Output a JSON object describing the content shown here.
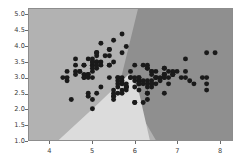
{
  "chart_data": {
    "type": "scatter",
    "title": "",
    "subtitle": "",
    "xlabel": "",
    "ylabel": "",
    "xlim": [
      3.5,
      8.3
    ],
    "ylim": [
      1.0,
      5.2
    ],
    "grid": false,
    "legend_position": "none",
    "xticks": [
      4,
      5,
      6,
      7,
      8
    ],
    "xtick_labels": [
      "4",
      "5",
      "6",
      "7",
      "8"
    ],
    "yticks": [
      1.0,
      1.5,
      2.0,
      2.5,
      3.0,
      3.5,
      4.0,
      4.5,
      5.0
    ],
    "ytick_labels": [
      "1.0",
      "1.5",
      "2.0",
      "2.5",
      "3.0",
      "3.5",
      "4.0",
      "4.5",
      "5.0"
    ],
    "background_color": "#b4b4b4",
    "regions": [
      {
        "name": "region-class-0",
        "label": "Class 0 decision region",
        "color": "#b2b2b2",
        "description": "Upper-left medium gray region"
      },
      {
        "name": "region-class-1",
        "label": "Class 1 decision region",
        "color": "#dcdcdc",
        "description": "Light gray wedge widening toward bottom-center"
      },
      {
        "name": "region-class-2",
        "label": "Class 2 decision region",
        "color": "#8f8f8f",
        "description": "Darker gray region on the right"
      }
    ],
    "series": [
      {
        "name": "Class 0",
        "marker": "circle",
        "color": "#1a1a1a",
        "points": [
          [
            5.1,
            3.5
          ],
          [
            4.9,
            3.0
          ],
          [
            4.7,
            3.2
          ],
          [
            4.6,
            3.1
          ],
          [
            5.0,
            3.6
          ],
          [
            5.4,
            3.9
          ],
          [
            4.6,
            3.4
          ],
          [
            5.0,
            3.4
          ],
          [
            4.4,
            2.9
          ],
          [
            4.9,
            3.1
          ],
          [
            5.4,
            3.7
          ],
          [
            4.8,
            3.4
          ],
          [
            4.8,
            3.0
          ],
          [
            4.3,
            3.0
          ],
          [
            5.8,
            4.0
          ],
          [
            5.7,
            4.4
          ],
          [
            5.4,
            3.9
          ],
          [
            5.1,
            3.5
          ],
          [
            5.7,
            3.8
          ],
          [
            5.1,
            3.8
          ],
          [
            5.4,
            3.4
          ],
          [
            5.1,
            3.7
          ],
          [
            4.6,
            3.6
          ],
          [
            5.1,
            3.3
          ],
          [
            4.8,
            3.4
          ],
          [
            5.0,
            3.0
          ],
          [
            5.0,
            3.4
          ],
          [
            5.2,
            3.5
          ],
          [
            5.2,
            3.4
          ],
          [
            4.7,
            3.2
          ],
          [
            4.8,
            3.1
          ],
          [
            5.4,
            3.4
          ],
          [
            5.2,
            4.1
          ],
          [
            5.5,
            4.2
          ],
          [
            4.9,
            3.1
          ],
          [
            5.0,
            3.2
          ],
          [
            5.5,
            3.5
          ],
          [
            4.9,
            3.6
          ],
          [
            4.4,
            3.0
          ],
          [
            5.1,
            3.4
          ],
          [
            5.0,
            3.5
          ],
          [
            4.5,
            2.3
          ],
          [
            4.4,
            3.2
          ],
          [
            5.0,
            3.5
          ],
          [
            5.1,
            3.8
          ],
          [
            4.8,
            3.0
          ],
          [
            5.1,
            3.8
          ],
          [
            4.6,
            3.2
          ],
          [
            5.3,
            3.7
          ],
          [
            5.0,
            3.3
          ]
        ]
      },
      {
        "name": "Class 1",
        "marker": "circle",
        "color": "#1a1a1a",
        "points": [
          [
            7.0,
            3.2
          ],
          [
            6.4,
            3.2
          ],
          [
            6.9,
            3.1
          ],
          [
            5.5,
            2.3
          ],
          [
            6.5,
            2.8
          ],
          [
            5.7,
            2.8
          ],
          [
            6.3,
            3.3
          ],
          [
            4.9,
            2.4
          ],
          [
            6.6,
            2.9
          ],
          [
            5.2,
            2.7
          ],
          [
            5.0,
            2.0
          ],
          [
            5.9,
            3.0
          ],
          [
            6.0,
            2.2
          ],
          [
            6.1,
            2.9
          ],
          [
            5.6,
            2.9
          ],
          [
            6.7,
            3.1
          ],
          [
            5.6,
            3.0
          ],
          [
            5.8,
            2.7
          ],
          [
            6.2,
            2.2
          ],
          [
            5.6,
            2.5
          ],
          [
            5.9,
            3.2
          ],
          [
            6.1,
            2.8
          ],
          [
            6.3,
            2.5
          ],
          [
            6.1,
            2.8
          ],
          [
            6.4,
            2.9
          ],
          [
            6.6,
            3.0
          ],
          [
            6.8,
            2.8
          ],
          [
            6.7,
            3.0
          ],
          [
            6.0,
            2.9
          ],
          [
            5.7,
            2.6
          ],
          [
            5.5,
            2.4
          ],
          [
            5.5,
            2.4
          ],
          [
            5.8,
            2.7
          ],
          [
            6.0,
            2.7
          ],
          [
            5.4,
            3.0
          ],
          [
            6.0,
            3.4
          ],
          [
            6.7,
            3.1
          ],
          [
            6.3,
            2.3
          ],
          [
            5.6,
            3.0
          ],
          [
            5.5,
            2.5
          ],
          [
            5.5,
            2.6
          ],
          [
            6.1,
            3.0
          ],
          [
            5.8,
            2.6
          ],
          [
            5.0,
            2.3
          ],
          [
            5.6,
            2.7
          ],
          [
            5.7,
            3.0
          ],
          [
            5.7,
            2.9
          ],
          [
            6.2,
            2.9
          ],
          [
            5.1,
            2.5
          ],
          [
            5.7,
            2.8
          ]
        ]
      },
      {
        "name": "Class 2",
        "marker": "circle",
        "color": "#1a1a1a",
        "points": [
          [
            6.3,
            3.3
          ],
          [
            5.8,
            2.7
          ],
          [
            7.1,
            3.0
          ],
          [
            6.3,
            2.9
          ],
          [
            6.5,
            3.0
          ],
          [
            7.6,
            3.0
          ],
          [
            4.9,
            2.5
          ],
          [
            7.3,
            2.9
          ],
          [
            6.7,
            2.5
          ],
          [
            7.2,
            3.6
          ],
          [
            6.5,
            3.2
          ],
          [
            6.4,
            2.7
          ],
          [
            6.8,
            3.0
          ],
          [
            5.7,
            2.5
          ],
          [
            5.8,
            2.8
          ],
          [
            6.4,
            3.2
          ],
          [
            6.5,
            3.0
          ],
          [
            7.7,
            3.8
          ],
          [
            7.7,
            2.6
          ],
          [
            6.0,
            2.2
          ],
          [
            6.9,
            3.2
          ],
          [
            5.6,
            2.8
          ],
          [
            7.7,
            2.8
          ],
          [
            6.3,
            2.7
          ],
          [
            6.7,
            3.3
          ],
          [
            7.2,
            3.2
          ],
          [
            6.2,
            2.8
          ],
          [
            6.1,
            3.0
          ],
          [
            6.4,
            2.8
          ],
          [
            7.2,
            3.0
          ],
          [
            7.4,
            2.8
          ],
          [
            7.9,
            3.8
          ],
          [
            6.4,
            2.8
          ],
          [
            6.3,
            2.8
          ],
          [
            6.1,
            2.6
          ],
          [
            7.7,
            3.0
          ],
          [
            6.3,
            3.4
          ],
          [
            6.4,
            3.1
          ],
          [
            6.0,
            3.0
          ],
          [
            6.9,
            3.1
          ],
          [
            6.7,
            3.1
          ],
          [
            6.9,
            3.1
          ],
          [
            5.8,
            2.7
          ],
          [
            6.8,
            3.2
          ],
          [
            6.7,
            3.3
          ],
          [
            6.7,
            3.0
          ],
          [
            6.3,
            2.5
          ],
          [
            6.5,
            3.0
          ],
          [
            6.2,
            3.4
          ],
          [
            5.9,
            3.0
          ]
        ]
      }
    ]
  }
}
